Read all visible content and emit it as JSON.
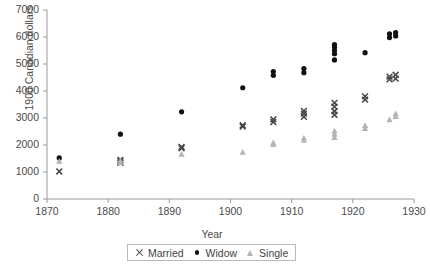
{
  "chart_data": {
    "type": "scatter",
    "title": "",
    "xlabel": "Year",
    "ylabel": "1900 Canadian dollars",
    "xlim": [
      1870,
      1930
    ],
    "ylim": [
      0,
      7000
    ],
    "grid": false,
    "legend_position": "bottom-center",
    "xticks": [
      1870,
      1880,
      1890,
      1900,
      1910,
      1920,
      1930
    ],
    "xtick_labels": [
      "1870",
      "1880",
      "1890",
      "1900",
      "1910",
      "1920",
      "1930"
    ],
    "yticks": [
      0,
      1000,
      2000,
      3000,
      4000,
      5000,
      6000,
      7000
    ],
    "ytick_labels": [
      "0",
      "1000",
      "2000",
      "3000",
      "4000",
      "5000",
      "6000",
      "7000"
    ],
    "series": [
      {
        "name": "Married",
        "marker": "x",
        "color": "#454545",
        "points": [
          [
            1872,
            1020
          ],
          [
            1882,
            1340
          ],
          [
            1882,
            1390
          ],
          [
            1882,
            1450
          ],
          [
            1892,
            1930
          ],
          [
            1892,
            1880
          ],
          [
            1902,
            2680
          ],
          [
            1902,
            2730
          ],
          [
            1907,
            2850
          ],
          [
            1907,
            2950
          ],
          [
            1912,
            3040
          ],
          [
            1912,
            3160
          ],
          [
            1912,
            3260
          ],
          [
            1917,
            3120
          ],
          [
            1917,
            3250
          ],
          [
            1917,
            3420
          ],
          [
            1917,
            3560
          ],
          [
            1922,
            3680
          ],
          [
            1922,
            3800
          ],
          [
            1926,
            4430
          ],
          [
            1926,
            4530
          ],
          [
            1927,
            4460
          ],
          [
            1927,
            4600
          ]
        ]
      },
      {
        "name": "Widow",
        "marker": "circle",
        "color": "#111111",
        "points": [
          [
            1872,
            1520
          ],
          [
            1882,
            2400
          ],
          [
            1892,
            3230
          ],
          [
            1902,
            4120
          ],
          [
            1907,
            4580
          ],
          [
            1907,
            4720
          ],
          [
            1912,
            4680
          ],
          [
            1912,
            4830
          ],
          [
            1917,
            5380
          ],
          [
            1917,
            5500
          ],
          [
            1917,
            5620
          ],
          [
            1917,
            5720
          ],
          [
            1917,
            5150
          ],
          [
            1922,
            5420
          ],
          [
            1926,
            5980
          ],
          [
            1926,
            6120
          ],
          [
            1927,
            6040
          ],
          [
            1927,
            6160
          ]
        ]
      },
      {
        "name": "Single",
        "marker": "triangle",
        "color": "#b4b4b4",
        "points": [
          [
            1872,
            1400
          ],
          [
            1882,
            1350
          ],
          [
            1882,
            1420
          ],
          [
            1892,
            1660
          ],
          [
            1902,
            1740
          ],
          [
            1907,
            2020
          ],
          [
            1907,
            2090
          ],
          [
            1912,
            2180
          ],
          [
            1912,
            2260
          ],
          [
            1917,
            2280
          ],
          [
            1917,
            2400
          ],
          [
            1917,
            2520
          ],
          [
            1922,
            2620
          ],
          [
            1922,
            2730
          ],
          [
            1926,
            2940
          ],
          [
            1927,
            3060
          ],
          [
            1927,
            3160
          ]
        ]
      }
    ]
  },
  "legend": {
    "items": [
      {
        "label": "Married",
        "marker": "x-marker"
      },
      {
        "label": "Widow",
        "marker": "dot-marker"
      },
      {
        "label": "Single",
        "marker": "triangle-marker"
      }
    ]
  },
  "axes": {
    "x_title": "Year",
    "y_title": "1900 Canadian dollars"
  },
  "colors": {
    "axis": "#9a9a9a",
    "text": "#4a4a4a",
    "married": "#454545",
    "widow": "#111111",
    "single": "#b4b4b4"
  }
}
